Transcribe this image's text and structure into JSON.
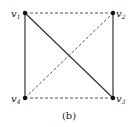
{
  "diagram": {
    "caption": "(b)",
    "vertices": [
      {
        "id": "v1",
        "base": "v",
        "sub": "1",
        "x": 25,
        "y": 13
      },
      {
        "id": "v2",
        "base": "v",
        "sub": "2",
        "x": 113,
        "y": 13
      },
      {
        "id": "v3",
        "base": "v",
        "sub": "3",
        "x": 113,
        "y": 98
      },
      {
        "id": "v4",
        "base": "v",
        "sub": "4",
        "x": 25,
        "y": 98
      }
    ],
    "edges": [
      {
        "from": "v1",
        "to": "v4",
        "style": "solid"
      },
      {
        "from": "v2",
        "to": "v3",
        "style": "solid"
      },
      {
        "from": "v1",
        "to": "v3",
        "style": "solid"
      },
      {
        "from": "v1",
        "to": "v2",
        "style": "dashed"
      },
      {
        "from": "v4",
        "to": "v3",
        "style": "dashed"
      },
      {
        "from": "v4",
        "to": "v2",
        "style": "dashed"
      }
    ]
  }
}
